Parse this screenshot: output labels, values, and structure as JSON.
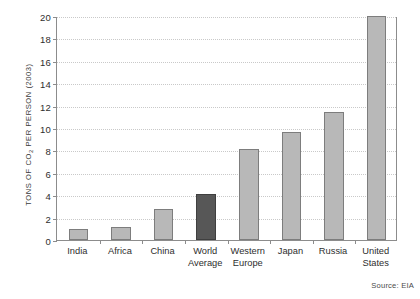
{
  "chart_data": {
    "type": "bar",
    "title": "",
    "subtitle": "",
    "xlabel": "",
    "ylabel": "TONS OF CO2 PER PERSON (2003)",
    "ylabel_parts": {
      "pre": "TONS OF CO",
      "sub": "2",
      "post": " PER PERSON (2003)"
    },
    "categories": [
      "India",
      "Africa",
      "China",
      "World\nAverage",
      "Western\nEurope",
      "Japan",
      "Russia",
      "United\nStates"
    ],
    "values": [
      1.0,
      1.2,
      2.8,
      4.1,
      8.1,
      9.6,
      11.4,
      20.0
    ],
    "ylim": [
      0,
      20
    ],
    "ytick_step": 2,
    "yticks": [
      0,
      2,
      4,
      6,
      8,
      10,
      12,
      14,
      16,
      18,
      20
    ],
    "ytick_labels": [
      "0",
      "2",
      "4",
      "6",
      "8",
      "10",
      "12",
      "14",
      "16",
      "18",
      "20"
    ],
    "grid": true,
    "grid_style": "dotted",
    "legend": "none",
    "highlight_index": 3,
    "colors": {
      "bar": "#b8b8b8",
      "bar_border": "#7d7d7d",
      "highlight_bar": "#575757",
      "highlight_border": "#3f3f3f",
      "gridline": "#c9c9c9",
      "axis": "#8c8c8c",
      "text": "#2e2e2e",
      "background": "#ffffff"
    }
  },
  "source": {
    "note": "Source: EIA"
  }
}
